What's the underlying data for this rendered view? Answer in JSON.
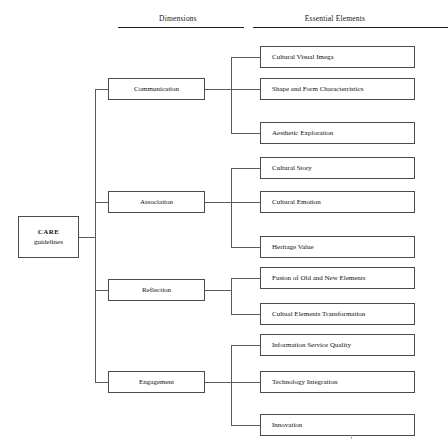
{
  "headers": {
    "dimensions": "Dimensions",
    "essential_elements": "Essential Elements"
  },
  "root": {
    "line1": "CARE",
    "line2": "guidelines"
  },
  "dimensions": [
    {
      "label": "Communication"
    },
    {
      "label": "Association"
    },
    {
      "label": "Reflection"
    },
    {
      "label": "Engagement"
    }
  ],
  "elements": [
    {
      "label": "Cultural Visual Imega",
      "dimension": "Communication"
    },
    {
      "label": "Shape and Form Characterristics",
      "dimension": "Communication"
    },
    {
      "label": "Aesthetic Exploration",
      "dimension": "Communication"
    },
    {
      "label": "Cultural Story",
      "dimension": "Association"
    },
    {
      "label": "Cultural Emotion",
      "dimension": "Association"
    },
    {
      "label": "Heritage Value",
      "dimension": "Association"
    },
    {
      "label": "Fusion of Old and New Elements",
      "dimension": "Reflection"
    },
    {
      "label": "Cultual Elements Transformation",
      "dimension": "Reflection"
    },
    {
      "label": "Information Service Quality",
      "dimension": "Engagement"
    },
    {
      "label": "Technology Integration",
      "dimension": "Engagement"
    },
    {
      "label": "Innovation",
      "dimension": "Engagement"
    }
  ],
  "colors": {
    "box_border": "#4a4a4a",
    "connector": "#5a5a5a",
    "rule": "#1d1d1d",
    "text": "#111111",
    "background": "#ffffff"
  }
}
